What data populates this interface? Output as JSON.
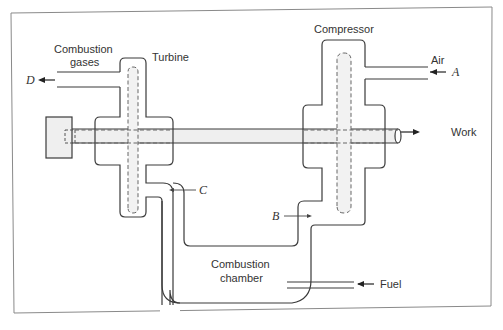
{
  "diagram": {
    "components": {
      "compressor": {
        "label": "Compressor"
      },
      "turbine": {
        "label": "Turbine"
      },
      "combustion_chamber": {
        "label_line1": "Combustion",
        "label_line2": "chamber"
      }
    },
    "streams": {
      "air": {
        "label": "Air",
        "point": "A"
      },
      "compressed": {
        "point": "B"
      },
      "hot_gas": {
        "point": "C"
      },
      "exhaust": {
        "label_line1": "Combustion",
        "label_line2": "gases",
        "point": "D"
      },
      "fuel": {
        "label": "Fuel"
      },
      "work": {
        "label": "Work"
      }
    },
    "colors": {
      "line": "#3a3a3a",
      "fill": "#efefef",
      "frame": "#888888"
    }
  }
}
